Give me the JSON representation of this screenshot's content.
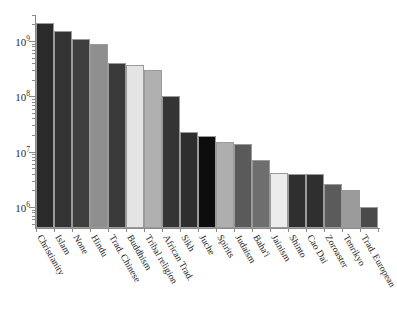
{
  "chart_data": {
    "type": "bar",
    "title": "",
    "xlabel": "",
    "ylabel": "",
    "yscale": "log",
    "ylim": [
      400000,
      3000000000
    ],
    "grid": false,
    "legend": null,
    "y_tick_labels": [
      "10⁶",
      "10⁷",
      "10⁸",
      "10⁹"
    ],
    "y_tick_values": [
      1000000,
      10000000,
      100000000,
      1000000000
    ],
    "categories": [
      "Christianity",
      "Islam",
      "None",
      "Hindu",
      "Trad. Chinese",
      "Buddhism",
      "Tribal religion",
      "African Trad.",
      "Sikh",
      "Juche",
      "Spirits",
      "Judaism",
      "Baha'i",
      "Jainism",
      "Shinto",
      "Cao Dai",
      "Zoroaster",
      "Tenrikyo",
      "Trad. European"
    ],
    "values": [
      2100000000,
      1500000000,
      1100000000,
      900000000,
      394000000,
      376000000,
      300000000,
      100000000,
      23000000,
      19000000,
      15000000,
      14000000,
      7000000,
      4200000,
      4000000,
      4000000,
      2600000,
      2000000,
      1000000
    ],
    "bar_colors": [
      "#2a2a2a",
      "#333333",
      "#3f3f3f",
      "#8f8f8f",
      "#3a3a3a",
      "#e4e4e4",
      "#b0b0b0",
      "#343434",
      "#2e2e2e",
      "#0d0d0d",
      "#aeaeae",
      "#5a5a5a",
      "#6e6e6e",
      "#ececec",
      "#2f2f2f",
      "#2f2f2f",
      "#5b5b5b",
      "#9b9b9b",
      "#4a4a4a"
    ]
  },
  "axis": {
    "y_axis_name": "adherents-log-axis",
    "x_axis_name": "religion-category-axis"
  }
}
